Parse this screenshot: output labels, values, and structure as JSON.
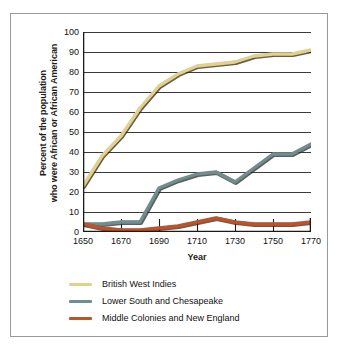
{
  "chart_data": {
    "type": "line",
    "title": "",
    "xlabel": "Year",
    "ylabel": "Percent of the population who were African or African American",
    "ylabel_line1": "Percent of the population",
    "ylabel_line2": "who were African or African American",
    "x": [
      1650,
      1660,
      1670,
      1680,
      1690,
      1700,
      1710,
      1720,
      1730,
      1740,
      1750,
      1760,
      1770
    ],
    "xlim": [
      1650,
      1770
    ],
    "ylim": [
      0,
      100
    ],
    "xticks": [
      1650,
      1670,
      1690,
      1710,
      1730,
      1750,
      1770
    ],
    "yticks": [
      0,
      10,
      20,
      30,
      40,
      50,
      60,
      70,
      80,
      90,
      100
    ],
    "grid": true,
    "legend_position": "below",
    "series": [
      {
        "name": "British West Indies",
        "color": "#e5d08a",
        "values": [
          23,
          38,
          48,
          62,
          73,
          79,
          83,
          84,
          85,
          88,
          89,
          89,
          91
        ]
      },
      {
        "name": "Lower South and Chesapeake",
        "color": "#6f8e90",
        "values": [
          4,
          4,
          5,
          5,
          22,
          26,
          29,
          30,
          25,
          32,
          39,
          39,
          44
        ]
      },
      {
        "name": "Middle Colonies and New England",
        "color": "#c0522a",
        "values": [
          4,
          2,
          1,
          1,
          2,
          3,
          5,
          7,
          5,
          4,
          4,
          4,
          5
        ]
      }
    ]
  },
  "legend": {
    "items": [
      {
        "label": "British West Indies",
        "color": "#e5d08a"
      },
      {
        "label": "Lower South and Chesapeake",
        "color": "#6f8e90"
      },
      {
        "label": "Middle Colonies and New England",
        "color": "#c0522a"
      }
    ]
  },
  "colors": {
    "frame_border": "#9a9a9a",
    "axis": "#1a1a1a",
    "gridline": "#3a3a3a",
    "background": "#ffffff"
  }
}
